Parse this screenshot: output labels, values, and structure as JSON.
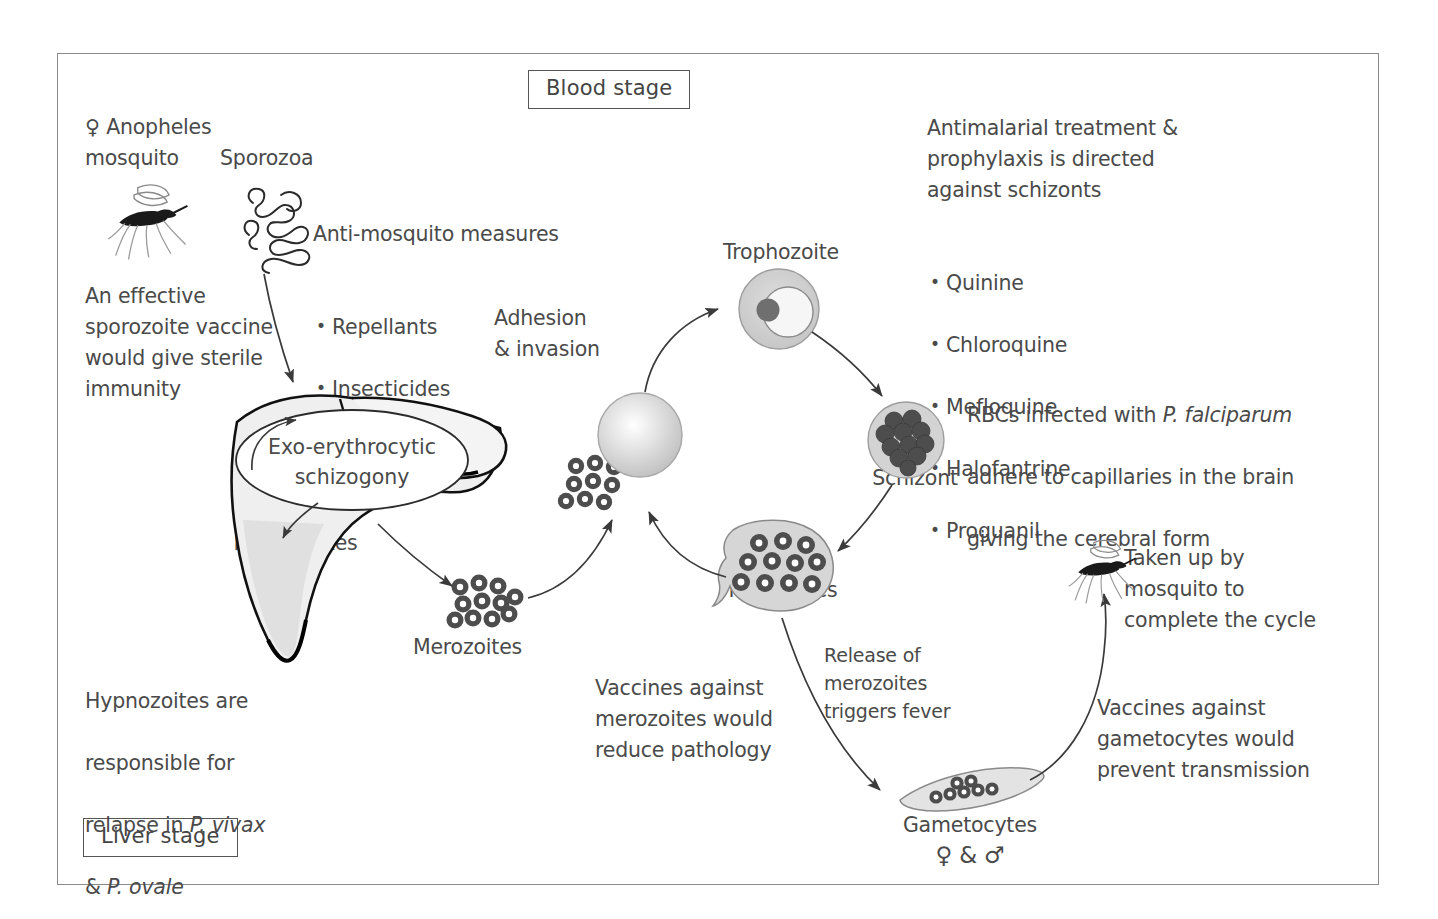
{
  "diagram": {
    "stage_labels": {
      "blood": "Blood stage",
      "liver": "Liver stage"
    },
    "annotations": {
      "anopheles": "♀ Anopheles\nmosquito",
      "sporozoa": "Sporozoa",
      "anti_mosquito_heading": "Anti-mosquito measures",
      "anti_mosquito_items": [
        "Repellants",
        "Insecticides",
        "Bed nets"
      ],
      "sporozoite_vaccine": "An effective\nsporozoite vaccine\nwould give sterile\nimmunity",
      "hypnozoite_relapse_line1": "Hypnozoites are",
      "hypnozoite_relapse_line2": "responsible for",
      "hypnozoite_relapse_line3_pre": "relapse in ",
      "hypnozoite_relapse_line3_ital": "P. vivax",
      "hypnozoite_relapse_line4_pre": "& ",
      "hypnozoite_relapse_line4_ital": "P. ovale",
      "adhesion": "Adhesion\n& invasion",
      "antimalarial_heading": "Antimalarial treatment &\nprophylaxis is directed\nagainst schizonts",
      "antimalarial_drugs": [
        "Quinine",
        "Chloroquine",
        "Mefloquine",
        "Halofantrine",
        "Proguanil"
      ],
      "rbc_line1_pre": "RBCs infected with ",
      "rbc_line1_ital": "P. falciparum",
      "rbc_line2": "adhere to capillaries in the brain",
      "rbc_line3": "giving the cerebral form",
      "vaccines_merozoites": "Vaccines against\nmerozoites would\nreduce pathology",
      "release_fever": "Release of\nmerozoites\ntriggers fever",
      "taken_up": "Taken up by\nmosquito to\ncomplete the cycle",
      "vaccines_gametocytes": "Vaccines against\ngametocytes would\nprevent transmission"
    },
    "structures": {
      "exo_erythrocytic": "Exo-erythrocytic\nschizogony",
      "hypnozoites": "Hypnozoites",
      "merozoites_liver": "Merozoites",
      "trophozoite": "Trophozoite",
      "schizont": "Schizont",
      "merozoites_blood": "Merozoites",
      "gametocytes": "Gametocytes",
      "gametocyte_sexes": "♀  &  ♂"
    },
    "icons": [
      "mosquito-icon-top",
      "sporozoa-icon",
      "liver-icon",
      "red-blood-cell-icon",
      "trophozoite-icon",
      "schizont-icon",
      "merozoite-cluster-icon",
      "gametocyte-icon",
      "mosquito-icon-bottom"
    ],
    "colors": {
      "frame_border": "#8a8a8a",
      "text": "#4a4a4a",
      "ink": "#2b2b2b",
      "cell_fill_light": "#d9d9d9",
      "cell_fill_mid": "#bdbdbd",
      "cell_fill_dark": "#565656",
      "liver_fill": "#efefef"
    }
  }
}
